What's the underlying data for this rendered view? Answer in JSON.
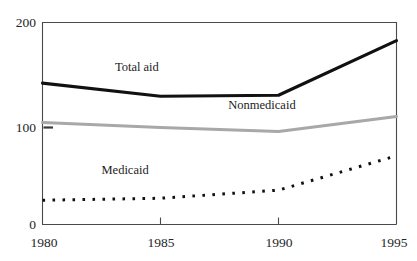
{
  "chart_data": {
    "type": "line",
    "title": "",
    "subtitle": "",
    "xlabel": "",
    "ylabel": "",
    "x": [
      1980,
      1985,
      1990,
      1995
    ],
    "xlim": [
      1980,
      1995
    ],
    "ylim": [
      0,
      200
    ],
    "xticks": [
      1980,
      1985,
      1990,
      1995
    ],
    "xtick_labels": [
      "1980",
      "1985",
      "1990",
      "1995"
    ],
    "yticks": [
      0,
      100,
      200
    ],
    "ytick_labels": [
      "0",
      "100",
      "200"
    ],
    "grid": false,
    "legend": "inline-labels",
    "series": [
      {
        "name": "Total aid",
        "style": "solid-thick-black",
        "color": "#111111",
        "values": [
          140,
          127,
          128,
          182
        ],
        "label": "Total aid",
        "label_x": 1984.0,
        "label_y": 152
      },
      {
        "name": "Nonmedicaid",
        "style": "solid-thick-gray",
        "color": "#a8a8a8",
        "values": [
          101,
          96,
          92,
          107
        ],
        "label": "Nonmedicaid",
        "label_x": 1989.3,
        "label_y": 114
      },
      {
        "name": "Medicaid",
        "style": "dotted-black",
        "color": "#111111",
        "values": [
          24,
          26,
          34,
          68
        ],
        "label": "Medicaid",
        "label_x": 1983.5,
        "label_y": 50
      }
    ],
    "annotations": [
      {
        "name": "y-axis-minor-tick-100",
        "value": 100,
        "note": "short interior tick mark at y=100"
      }
    ]
  }
}
